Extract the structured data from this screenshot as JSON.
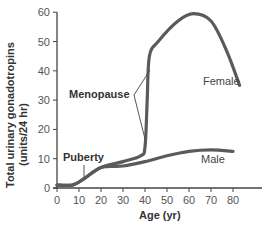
{
  "chart_data": {
    "type": "line",
    "title": "",
    "xlabel": "Age (yr)",
    "ylabel": "Total urinary gonadotropins (units/24 hr)",
    "ylabel_lines": [
      "Total urinary gonadotropins",
      "(units/24 hr)"
    ],
    "xlim": [
      0,
      85
    ],
    "ylim": [
      0,
      60
    ],
    "xticks": [
      0,
      10,
      20,
      30,
      40,
      50,
      60,
      70,
      80
    ],
    "yticks": [
      0,
      10,
      20,
      30,
      40,
      50,
      60
    ],
    "grid": false,
    "series": [
      {
        "name": "Female",
        "x": [
          0,
          7,
          12,
          20,
          30,
          38,
          40,
          41,
          42,
          46,
          55,
          62,
          70,
          77,
          83
        ],
        "values": [
          1,
          1,
          3,
          7,
          9,
          11,
          14,
          30,
          45,
          50,
          57,
          59.5,
          57,
          47,
          35
        ]
      },
      {
        "name": "Male",
        "x": [
          0,
          7,
          12,
          20,
          30,
          40,
          50,
          60,
          70,
          80
        ],
        "values": [
          1,
          1,
          3,
          7,
          7.5,
          9,
          11,
          12.5,
          13,
          12.5
        ]
      }
    ],
    "annotations": [
      {
        "text": "Puberty",
        "age": 12
      },
      {
        "text": "Menopause",
        "age_range": [
          40,
          43
        ]
      }
    ],
    "line_color": "#5a5a5a"
  },
  "labels": {
    "puberty": "Puberty",
    "menopause": "Menopause",
    "female": "Female",
    "male": "Male",
    "xlabel": "Age (yr)",
    "ylabel_line1": "Total urinary gonadotropins",
    "ylabel_line2": "(units/24 hr)"
  }
}
